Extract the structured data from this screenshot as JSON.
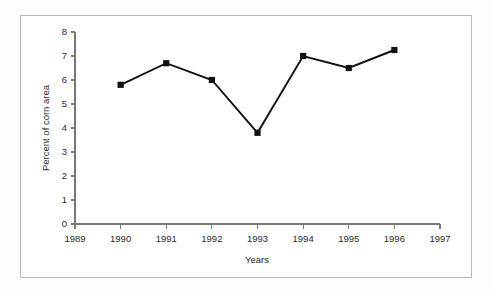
{
  "chart_data": {
    "type": "line",
    "title": "",
    "subtitle": "",
    "xlabel": "Years",
    "ylabel": "Percent of corn area",
    "x": [
      1990,
      1991,
      1992,
      1993,
      1994,
      1995,
      1996
    ],
    "values": [
      5.8,
      6.7,
      6.0,
      3.8,
      7.0,
      6.5,
      7.25
    ],
    "series": [
      {
        "name": "Percent of corn area",
        "values": [
          5.8,
          6.7,
          6.0,
          3.8,
          7.0,
          6.5,
          7.25
        ],
        "color": "#111111",
        "marker": "filled-square",
        "line_style": "solid"
      }
    ],
    "xlim": [
      1989,
      1997
    ],
    "ylim": [
      0,
      8
    ],
    "x_tick_labels": [
      "1989",
      "1990",
      "1991",
      "1992",
      "1993",
      "1994",
      "1995",
      "1996",
      "1997"
    ],
    "x_tick_values": [
      1989,
      1990,
      1991,
      1992,
      1993,
      1994,
      1995,
      1996,
      1997
    ],
    "y_tick_labels": [
      "0",
      "1",
      "2",
      "3",
      "4",
      "5",
      "6",
      "7",
      "8"
    ],
    "y_tick_values": [
      0,
      1,
      2,
      3,
      4,
      5,
      6,
      7,
      8
    ],
    "grid": false,
    "legend": false,
    "legend_position": "none",
    "annotations": []
  },
  "figure": {
    "frame_color": "#b9b9b9",
    "axis_color": "#7a7a7a",
    "background": "#ffffff"
  }
}
